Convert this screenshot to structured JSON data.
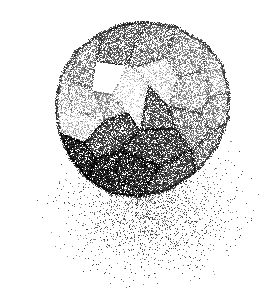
{
  "artwork": {
    "title": "Stippled Faceted Polyhedron",
    "description": "Pen-and-ink stipple rendering of a faceted polyhedral solid resting above a soft radial stipple shadow.",
    "medium": "stipple / dithered halftone",
    "canvas": {
      "width": 268,
      "height": 295
    },
    "background_color": "#ffffff",
    "ink_color": "#1a1a1a",
    "seed": 20240517
  },
  "light": {
    "direction_label": "upper-left",
    "x": -0.55,
    "y": -0.62,
    "z": 0.56
  },
  "solid": {
    "name": "faceted-polyhedron",
    "center": {
      "x": 143,
      "y": 108
    },
    "radius": 88,
    "silhouette": [
      [
        146,
        22
      ],
      [
        176,
        27
      ],
      [
        203,
        42
      ],
      [
        222,
        64
      ],
      [
        229,
        92
      ],
      [
        228,
        120
      ],
      [
        216,
        148
      ],
      [
        196,
        172
      ],
      [
        169,
        190
      ],
      [
        140,
        197
      ],
      [
        112,
        194
      ],
      [
        88,
        180
      ],
      [
        70,
        158
      ],
      [
        59,
        132
      ],
      [
        56,
        104
      ],
      [
        61,
        76
      ],
      [
        76,
        51
      ],
      [
        101,
        33
      ],
      [
        123,
        24
      ]
    ],
    "facets": [
      {
        "name": "crown-top-left",
        "tone": 0.5,
        "poly": [
          [
            146,
            22
          ],
          [
            123,
            24
          ],
          [
            101,
            33
          ],
          [
            96,
            62
          ],
          [
            126,
            66
          ]
        ]
      },
      {
        "name": "crown-top-center",
        "tone": 0.46,
        "poly": [
          [
            146,
            22
          ],
          [
            176,
            27
          ],
          [
            166,
            58
          ],
          [
            134,
            68
          ],
          [
            126,
            66
          ]
        ]
      },
      {
        "name": "crown-top-right",
        "tone": 0.4,
        "poly": [
          [
            176,
            27
          ],
          [
            203,
            42
          ],
          [
            205,
            70
          ],
          [
            178,
            78
          ],
          [
            166,
            58
          ]
        ]
      },
      {
        "name": "upper-right-bevel",
        "tone": 0.33,
        "poly": [
          [
            203,
            42
          ],
          [
            222,
            64
          ],
          [
            229,
            92
          ],
          [
            210,
            96
          ],
          [
            205,
            70
          ]
        ]
      },
      {
        "name": "right-shoulder",
        "tone": 0.44,
        "poly": [
          [
            229,
            92
          ],
          [
            228,
            120
          ],
          [
            212,
            132
          ],
          [
            200,
            112
          ],
          [
            210,
            96
          ]
        ]
      },
      {
        "name": "upper-left-bevel",
        "tone": 0.38,
        "poly": [
          [
            101,
            33
          ],
          [
            76,
            51
          ],
          [
            68,
            80
          ],
          [
            92,
            90
          ],
          [
            96,
            62
          ]
        ]
      },
      {
        "name": "left-shoulder",
        "tone": 0.22,
        "poly": [
          [
            76,
            51
          ],
          [
            61,
            76
          ],
          [
            56,
            104
          ],
          [
            72,
            110
          ],
          [
            68,
            80
          ]
        ]
      },
      {
        "name": "left-face-upper",
        "tone": 0.26,
        "poly": [
          [
            68,
            80
          ],
          [
            72,
            110
          ],
          [
            104,
            120
          ],
          [
            112,
            94
          ],
          [
            92,
            90
          ]
        ]
      },
      {
        "name": "left-face-lower",
        "tone": 0.2,
        "poly": [
          [
            56,
            104
          ],
          [
            59,
            132
          ],
          [
            84,
            142
          ],
          [
            104,
            120
          ],
          [
            72,
            110
          ]
        ]
      },
      {
        "name": "mid-left-panel",
        "tone": 0.3,
        "poly": [
          [
            92,
            90
          ],
          [
            112,
            94
          ],
          [
            128,
            112
          ],
          [
            104,
            120
          ]
        ]
      },
      {
        "name": "highlight-wedge",
        "tone": 0.12,
        "poly": [
          [
            134,
            68
          ],
          [
            148,
            84
          ],
          [
            140,
            130
          ],
          [
            128,
            112
          ],
          [
            112,
            94
          ],
          [
            126,
            66
          ]
        ]
      },
      {
        "name": "bright-facet-right",
        "tone": 0.18,
        "poly": [
          [
            134,
            68
          ],
          [
            166,
            58
          ],
          [
            178,
            78
          ],
          [
            168,
            106
          ],
          [
            148,
            84
          ]
        ]
      },
      {
        "name": "center-right-panel",
        "tone": 0.36,
        "poly": [
          [
            178,
            78
          ],
          [
            205,
            70
          ],
          [
            210,
            96
          ],
          [
            200,
            112
          ],
          [
            168,
            106
          ]
        ]
      },
      {
        "name": "core-shadow-facet",
        "tone": 0.62,
        "poly": [
          [
            148,
            84
          ],
          [
            168,
            106
          ],
          [
            176,
            128
          ],
          [
            140,
            130
          ]
        ]
      },
      {
        "name": "right-lower-panel",
        "tone": 0.52,
        "poly": [
          [
            168,
            106
          ],
          [
            200,
            112
          ],
          [
            212,
            132
          ],
          [
            192,
            150
          ],
          [
            176,
            128
          ]
        ]
      },
      {
        "name": "right-rim",
        "tone": 0.58,
        "poly": [
          [
            212,
            132
          ],
          [
            228,
            120
          ],
          [
            216,
            148
          ],
          [
            196,
            172
          ],
          [
            192,
            150
          ]
        ]
      },
      {
        "name": "under-ledge-left",
        "tone": 0.66,
        "poly": [
          [
            84,
            142
          ],
          [
            104,
            120
          ],
          [
            128,
            112
          ],
          [
            140,
            130
          ],
          [
            120,
            150
          ],
          [
            96,
            158
          ]
        ]
      },
      {
        "name": "under-ledge-center",
        "tone": 0.72,
        "poly": [
          [
            140,
            130
          ],
          [
            176,
            128
          ],
          [
            192,
            150
          ],
          [
            160,
            166
          ],
          [
            120,
            150
          ]
        ]
      },
      {
        "name": "base-shadow-left",
        "tone": 0.78,
        "poly": [
          [
            59,
            132
          ],
          [
            84,
            142
          ],
          [
            96,
            158
          ],
          [
            88,
            180
          ],
          [
            70,
            158
          ]
        ]
      },
      {
        "name": "base-shadow-mid",
        "tone": 0.82,
        "poly": [
          [
            96,
            158
          ],
          [
            120,
            150
          ],
          [
            160,
            166
          ],
          [
            140,
            197
          ],
          [
            112,
            194
          ],
          [
            88,
            180
          ]
        ]
      },
      {
        "name": "base-shadow-right",
        "tone": 0.74,
        "poly": [
          [
            160,
            166
          ],
          [
            192,
            150
          ],
          [
            196,
            172
          ],
          [
            169,
            190
          ],
          [
            140,
            197
          ]
        ]
      }
    ]
  },
  "cast_shadow": {
    "name": "ground-shadow",
    "center": {
      "x": 150,
      "y": 205
    },
    "radius_x": 118,
    "radius_y": 92,
    "inner_density": 0.3,
    "falloff_exponent": 2.6,
    "dot_color": "#3c3c3c"
  },
  "stipple": {
    "dot_size_px": 1,
    "max_density": 0.92,
    "min_density": 0.02,
    "edge_darkening": 0.18
  },
  "labels": {
    "figure_caption": "Stippled faceted polyhedron with cast shadow"
  }
}
